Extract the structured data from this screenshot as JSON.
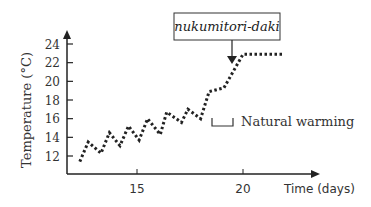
{
  "chart_data": {
    "type": "line",
    "title": "",
    "xlabel": "Time (days)",
    "ylabel": "Temperature (°C)",
    "x_ticks": [
      15,
      20
    ],
    "y_ticks": [
      12,
      14,
      16,
      18,
      20,
      22,
      24
    ],
    "xlim": [
      11.0,
      23.5
    ],
    "ylim": [
      10.0,
      25.0
    ],
    "grid": false,
    "line_style": "dotted",
    "series": [
      {
        "name": "Temperature",
        "x": [
          12.3,
          12.7,
          13.3,
          13.7,
          14.2,
          14.6,
          15.1,
          15.5,
          16.1,
          16.4,
          17.1,
          17.4,
          18.0,
          18.4,
          19.1,
          20.0,
          21.9
        ],
        "y": [
          11.4,
          13.5,
          12.3,
          14.5,
          13.1,
          15.2,
          13.7,
          16.0,
          14.3,
          16.7,
          15.6,
          17.0,
          16.0,
          18.9,
          19.3,
          22.9,
          22.9
        ]
      }
    ],
    "annotations": [
      {
        "text": "nukumitori-daki",
        "style": "boxed italic",
        "arrow_to": {
          "x": 19.5,
          "y": 21.9
        }
      },
      {
        "text": "Natural warming",
        "style": "bracket legend"
      }
    ]
  },
  "labels": {
    "y_axis_title": "Temperature (°C)",
    "x_axis_title": "Time (days)",
    "y_tick_labels": [
      "24",
      "22",
      "20",
      "18",
      "16",
      "14",
      "12"
    ],
    "x_tick_labels": [
      "15",
      "20"
    ],
    "callout": "nukumitori-daki",
    "legend": "Natural warming"
  }
}
